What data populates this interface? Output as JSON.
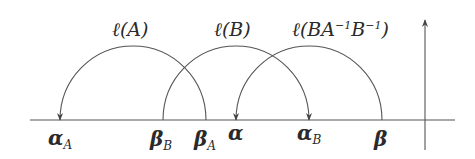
{
  "diagram": {
    "axis": {
      "horizontal": {
        "x1": 30,
        "x2": 455,
        "y": 120
      },
      "vertical": {
        "x": 425,
        "y1": 150,
        "y2": 18
      }
    },
    "points": [
      {
        "id": "alpha_A",
        "x": 60,
        "symbol": "α",
        "subscript": "A"
      },
      {
        "id": "beta_B",
        "x": 163,
        "symbol": "β",
        "subscript": "B"
      },
      {
        "id": "beta_A",
        "x": 206,
        "symbol": "β",
        "subscript": "A"
      },
      {
        "id": "alpha",
        "x": 236,
        "symbol": "α",
        "subscript": ""
      },
      {
        "id": "alpha_B",
        "x": 309,
        "symbol": "α",
        "subscript": "B"
      },
      {
        "id": "beta",
        "x": 382,
        "symbol": "β",
        "subscript": ""
      }
    ],
    "arcs": [
      {
        "id": "arc-l-A",
        "from": "β_A",
        "to": "α_A",
        "label": "ℓ(A)",
        "label_prefix": "ℓ(A)",
        "label_parts": []
      },
      {
        "id": "arc-l-B",
        "from": "β_B",
        "to": "α_B",
        "label": "ℓ(B)"
      },
      {
        "id": "arc-l-BA-1B-1",
        "from": "β",
        "to": "α",
        "label": "ℓ(BA⁻¹B⁻¹)"
      }
    ],
    "labels": {
      "arc_A": "ℓ(A)",
      "arc_B": "ℓ(B)",
      "arc_C_p1": "ℓ(BA",
      "arc_C_sup1": "−1",
      "arc_C_p2": "B",
      "arc_C_sup2": "−1",
      "arc_C_p3": ")",
      "alpha": "α",
      "beta": "β",
      "sub_A": "A",
      "sub_B": "B"
    },
    "colors": {
      "stroke": "#555555",
      "text": "#2a2a2a",
      "background": "#ffffff"
    }
  }
}
